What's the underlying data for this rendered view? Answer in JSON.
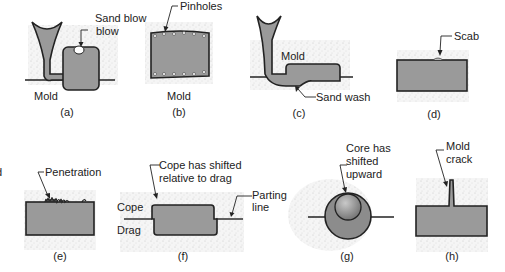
{
  "figure": {
    "panels": [
      {
        "id": "a",
        "caption": "(a)",
        "labels": [
          "Sand blow",
          "Mold"
        ],
        "defect": "Sand blow"
      },
      {
        "id": "b",
        "caption": "(b)",
        "labels": [
          "Pinholes",
          "Mold"
        ],
        "defect": "Pinholes"
      },
      {
        "id": "c",
        "caption": "(c)",
        "labels": [
          "Mold",
          "Sand wash"
        ],
        "defect": "Sand wash"
      },
      {
        "id": "d",
        "caption": "(d)",
        "labels": [
          "Scab"
        ],
        "defect": "Scab"
      },
      {
        "id": "e",
        "caption": "(e)",
        "labels": [
          "Penetration"
        ],
        "defect": "Penetration"
      },
      {
        "id": "f",
        "caption": "(f)",
        "labels": [
          "Cope has shifted",
          "relative to drag",
          "Cope",
          "Drag",
          "Parting",
          "line"
        ],
        "defect": "Mold shift"
      },
      {
        "id": "g",
        "caption": "(g)",
        "labels": [
          "Core has",
          "shifted",
          "upward"
        ],
        "defect": "Core shift"
      },
      {
        "id": "h",
        "caption": "(h)",
        "labels": [
          "Mold",
          "crack"
        ],
        "defect": "Mold crack"
      }
    ],
    "edge_fragment": "d",
    "colors": {
      "metal": "#9a9a9a",
      "outline": "#222222",
      "sand": "#cfcfcf",
      "background": "#ffffff"
    }
  }
}
